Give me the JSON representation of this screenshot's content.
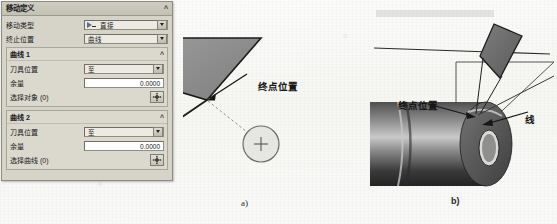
{
  "dialog": {
    "title": "移动定义",
    "collapse_icon": "chevron-up-icon",
    "fields": [
      {
        "label": "移动类型",
        "value": "直接",
        "icon": "tool-move-icon"
      },
      {
        "label": "终止位置",
        "value": "曲线"
      }
    ],
    "groups": [
      {
        "title": "曲线 1",
        "collapse_icon": "chevron-up-icon",
        "tool_pos_label": "刀具位置",
        "tool_pos_value": "至",
        "stock_label": "余量",
        "stock_value": "0.0000",
        "select_label": "选择对象 (0)",
        "select_icon": "point-select-icon"
      },
      {
        "title": "曲线 2",
        "collapse_icon": "chevron-up-icon",
        "tool_pos_label": "刀具位置",
        "tool_pos_value": "至",
        "stock_label": "余量",
        "stock_value": "0.0000",
        "select_label": "选择曲线 (0)",
        "select_icon": "point-select-icon"
      }
    ]
  },
  "figures": {
    "a": {
      "caption": "a)",
      "annotation_end_point": "终点位置"
    },
    "b": {
      "caption": "b)",
      "annotation_end_point": "终点位置",
      "annotation_line": "线"
    }
  },
  "colors": {
    "dialog_bg": "#d6d3c8",
    "tool_fill_a": "#8a8a8a",
    "tool_fill_b": "#6e6e6e",
    "paper_bg": "#fbfbf9",
    "annotation_text": "#171714"
  }
}
